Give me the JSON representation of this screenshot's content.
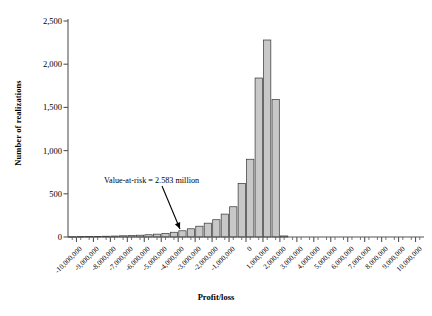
{
  "chart_data": {
    "type": "bar",
    "title": "",
    "xlabel": "Profit/loss",
    "ylabel": "Number of realizations",
    "ylim": [
      0,
      2500
    ],
    "xlim": [
      -10500000,
      10500000
    ],
    "grid": false,
    "legend": null,
    "bar_fill": "#c8c8c8",
    "bar_stroke": "#333333",
    "axis_color": "#555555",
    "y_ticks": [
      0,
      500,
      1000,
      1500,
      2000,
      2500
    ],
    "y_tick_labels": [
      "0",
      "500",
      "1,000",
      "1,500",
      "2,000",
      "2,500"
    ],
    "x_ticks": [
      -10000000,
      -9000000,
      -8000000,
      -7000000,
      -6000000,
      -5000000,
      -4000000,
      -3000000,
      -2000000,
      -1000000,
      0,
      1000000,
      2000000,
      3000000,
      4000000,
      5000000,
      6000000,
      7000000,
      8000000,
      9000000,
      10000000
    ],
    "x_tick_labels": [
      "-10,000,000",
      "-9,000,000",
      "-8,000,000",
      "-7,000,000",
      "-6,000,000",
      "-5,000,000",
      "-4,000,000",
      "-3,000,000",
      "-2,000,000",
      "-1,000,000",
      "0",
      "1,000,000",
      "2,000,000",
      "3,000,000",
      "4,000,000",
      "5,000,000",
      "6,000,000",
      "7,000,000",
      "8,000,000",
      "9,000,000",
      "10,000,000"
    ],
    "bin_width": 500000,
    "categories": [
      -10250000,
      -9750000,
      -9250000,
      -8750000,
      -8250000,
      -7750000,
      -7250000,
      -6750000,
      -6250000,
      -5750000,
      -5250000,
      -4750000,
      -4250000,
      -3750000,
      -3250000,
      -2750000,
      -2250000,
      -1750000,
      -1250000,
      -750000,
      -250000,
      250000,
      750000,
      1250000,
      1750000,
      2250000,
      2750000,
      3250000,
      3750000,
      4250000,
      4750000,
      5250000,
      5750000,
      6250000,
      6750000,
      7250000,
      7750000,
      8250000,
      8750000,
      9250000,
      9750000
    ],
    "values": [
      4,
      5,
      6,
      7,
      9,
      11,
      14,
      17,
      21,
      26,
      33,
      42,
      55,
      72,
      95,
      125,
      160,
      200,
      265,
      350,
      620,
      900,
      1840,
      2280,
      1590,
      12,
      0,
      0,
      0,
      0,
      0,
      0,
      0,
      0,
      0,
      0,
      0,
      0,
      0,
      0,
      0
    ],
    "annotations": [
      {
        "text": "Value-at-risk = 2.583 million",
        "text_x": 104,
        "text_y": 176,
        "arrow_from_x": 162,
        "arrow_from_y": 186,
        "arrow_to_x": 180,
        "arrow_to_y": 229
      }
    ]
  }
}
